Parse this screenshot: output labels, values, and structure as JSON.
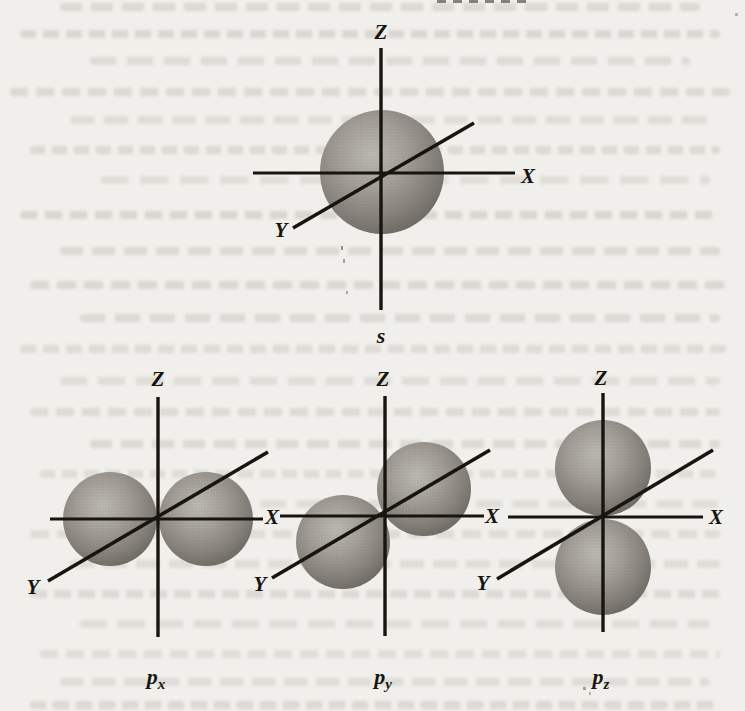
{
  "figure": {
    "orbitals": [
      {
        "id": "s",
        "caption_base": "s",
        "caption_sub": "",
        "axis_z": "Z",
        "axis_x": "X",
        "axis_y": "Y"
      },
      {
        "id": "px",
        "caption_base": "p",
        "caption_sub": "x",
        "axis_z": "Z",
        "axis_x": "X",
        "axis_y": "Y"
      },
      {
        "id": "py",
        "caption_base": "p",
        "caption_sub": "y",
        "axis_z": "Z",
        "axis_x": "X",
        "axis_y": "Y"
      },
      {
        "id": "pz",
        "caption_base": "p",
        "caption_sub": "z",
        "axis_z": "Z",
        "axis_x": "X",
        "axis_y": "Y"
      }
    ],
    "colors": {
      "page_background": "#f1efeb",
      "bleed_text": "#aca89f",
      "axis_line": "#17150f",
      "sphere_highlight": "#bcb9b3",
      "sphere_mid": "#8f8b85",
      "sphere_shadow": "#5f5c57"
    }
  }
}
